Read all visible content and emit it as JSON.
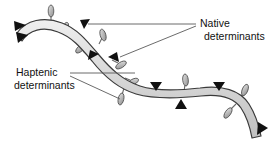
{
  "figure": {
    "background_color": "#ffffff"
  },
  "labels": {
    "native": {
      "line1": "Native",
      "line2": "determinants"
    },
    "haptenic": {
      "line1": "Haptenic",
      "line2": "determinants"
    }
  },
  "colors": {
    "ribbon_fill": "#d4d4d4",
    "ribbon_fill_light": "#efefef",
    "ribbon_edge": "#3a3a3a",
    "marker_dark": "#111111",
    "marker_light": "#a9a9a9",
    "marker_edge": "#4a4a4a",
    "leader_line": "#5a5a5a",
    "text": "#111111"
  },
  "markers": {
    "native_determinant_count": 9,
    "haptenic_determinant_count": 9,
    "native_shape": "solid-black-triangle",
    "haptenic_shape": "gray-lozenge-on-stalk"
  }
}
